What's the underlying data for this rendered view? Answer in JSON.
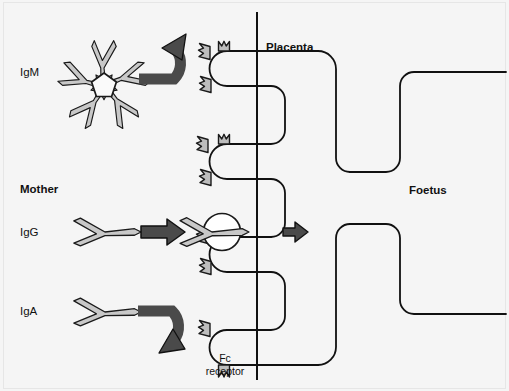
{
  "figure": {
    "title_visible": false,
    "background_color": "#f5f5f5",
    "ink_color": "#111111",
    "antibody_fill": "#c8c8c8",
    "antibody_stroke": "#1a1a1a",
    "arrow_fill": "#4a4a4a",
    "arrow_stroke": "#111111",
    "receptor_fill": "#bdbdbd"
  },
  "labels": {
    "igm": "IgM",
    "mother": "Mother",
    "igg": "IgG",
    "iga": "IgA",
    "placenta": "Placenta",
    "foetus": "Foetus",
    "fc_receptor_line1": "Fc",
    "fc_receptor_line2": "receptor"
  },
  "molecules": [
    {
      "name": "IgM",
      "label": "IgM",
      "shape": "pentamer-star",
      "subunits": 5,
      "crosses_placenta": false,
      "transport_arrow": "curved-up-blocked"
    },
    {
      "name": "IgG",
      "label": "IgG",
      "shape": "y-monomer",
      "subunits": 1,
      "crosses_placenta": true,
      "transport_arrow": "straight-right"
    },
    {
      "name": "IgA",
      "label": "IgA",
      "shape": "y-monomer",
      "subunits": 1,
      "crosses_placenta": false,
      "transport_arrow": "curved-down-blocked"
    }
  ],
  "compartments": [
    {
      "name": "mother",
      "label": "Mother",
      "side": "left"
    },
    {
      "name": "placenta",
      "label": "Placenta",
      "side": "middle"
    },
    {
      "name": "foetus",
      "label": "Foetus",
      "side": "right"
    }
  ],
  "receptors": [
    {
      "name": "fc-receptor",
      "label": "Fc receptor",
      "count": 4,
      "bound_molecule": "IgG"
    }
  ],
  "arrows": [
    {
      "name": "igm-blocked-arrow",
      "type": "curved-up",
      "from": "IgM",
      "meaning": "IgM does not cross"
    },
    {
      "name": "igg-transport-arrow",
      "type": "straight-right",
      "from": "IgG",
      "meaning": "IgG binds Fc receptor"
    },
    {
      "name": "igg-crosses-arrow",
      "type": "straight-right-small",
      "from": "IgG",
      "meaning": "IgG crosses to foetus"
    },
    {
      "name": "iga-blocked-arrow",
      "type": "curved-down",
      "from": "IgA",
      "meaning": "IgA does not cross"
    }
  ]
}
